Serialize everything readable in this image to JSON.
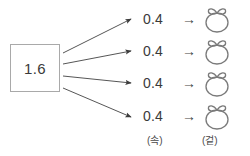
{
  "diagram": {
    "source": {
      "value": "1.6",
      "name": "source-quantity-box"
    },
    "arrow_color": "#4a4a4a",
    "box_border_color": "#a9a9a9",
    "text_color": "#3a3a3a",
    "fruit_outline_color": "#7a7a7a",
    "maps_to_symbol": "→",
    "parts": [
      {
        "value": "0.4",
        "arrow": "→",
        "fruit": "tangerine-icon"
      },
      {
        "value": "0.4",
        "arrow": "→",
        "fruit": "tangerine-icon"
      },
      {
        "value": "0.4",
        "arrow": "→",
        "fruit": "tangerine-icon"
      },
      {
        "value": "0.4",
        "arrow": "→",
        "fruit": "tangerine-icon"
      }
    ],
    "captions": {
      "inner": "(속)",
      "outer": "(겉)"
    }
  }
}
